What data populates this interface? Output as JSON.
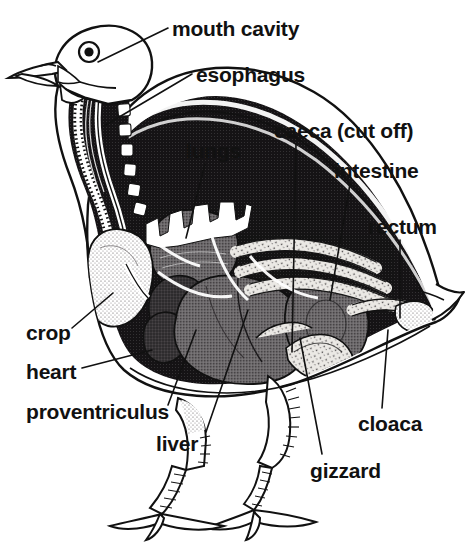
{
  "figure": {
    "background_color": "#ffffff",
    "ink_color": "#111111",
    "organ_gray": "#6d6a6c",
    "organ_dark": "#3a3739",
    "cavity_black": "#151315",
    "stipple_light": "#e8e6e2"
  },
  "labels": [
    {
      "id": "mouth-cavity",
      "text": "mouth cavity",
      "x": 172,
      "y": 18,
      "anchor": "left"
    },
    {
      "id": "esophagus",
      "text": "esophagus",
      "x": 196,
      "y": 64,
      "anchor": "left"
    },
    {
      "id": "caeca-cut-off",
      "text": "caeca (cut off)",
      "x": 274,
      "y": 120,
      "anchor": "left"
    },
    {
      "id": "lungs",
      "text": "lungs",
      "x": 186,
      "y": 140,
      "anchor": "left"
    },
    {
      "id": "intestine",
      "text": "intestine",
      "x": 334,
      "y": 160,
      "anchor": "left"
    },
    {
      "id": "rectum",
      "text": "rectum",
      "x": 368,
      "y": 216,
      "anchor": "left"
    },
    {
      "id": "crop",
      "text": "crop",
      "x": 26,
      "y": 322,
      "anchor": "left"
    },
    {
      "id": "heart",
      "text": "heart",
      "x": 26,
      "y": 361,
      "anchor": "left"
    },
    {
      "id": "proventriculus",
      "text": "proventriculus",
      "x": 26,
      "y": 401,
      "anchor": "left"
    },
    {
      "id": "liver",
      "text": "liver",
      "x": 156,
      "y": 433,
      "anchor": "left"
    },
    {
      "id": "gizzard",
      "text": "gizzard",
      "x": 310,
      "y": 460,
      "anchor": "left"
    },
    {
      "id": "cloaca",
      "text": "cloaca",
      "x": 358,
      "y": 413,
      "anchor": "left"
    }
  ],
  "leader_lines": [
    {
      "id": "leader-mouth-cavity",
      "for": "mouth-cavity",
      "points": "168,28 98,62"
    },
    {
      "id": "leader-esophagus",
      "for": "esophagus",
      "points": "192,74 104,126"
    },
    {
      "id": "leader-lungs",
      "for": "lungs",
      "points": "205,164 186,238"
    },
    {
      "id": "leader-caeca",
      "for": "caeca-cut-off",
      "points": "296,144 292,352"
    },
    {
      "id": "leader-intestine",
      "for": "intestine",
      "points": "350,184 330,300"
    },
    {
      "id": "leader-rectum",
      "for": "rectum",
      "points": "400,240 400,318"
    },
    {
      "id": "leader-crop",
      "for": "crop",
      "points": "72,328 113,293"
    },
    {
      "id": "leader-heart",
      "for": "heart",
      "points": "82,368 152,350"
    },
    {
      "id": "leader-proventriculus",
      "for": "proventriculus",
      "points": "168,405 196,330"
    },
    {
      "id": "leader-liver",
      "for": "liver",
      "points": "206,432 248,310"
    },
    {
      "id": "leader-gizzard",
      "for": "gizzard",
      "points": "322,454 300,338"
    },
    {
      "id": "leader-cloaca",
      "for": "cloaca",
      "points": "382,408 388,330"
    }
  ],
  "organs": [
    {
      "id": "crop-organ",
      "name": "crop",
      "shading": "light stipple"
    },
    {
      "id": "heart-organ",
      "name": "heart",
      "shading": "dark"
    },
    {
      "id": "liver-organ",
      "name": "liver",
      "shading": "mid gray stipple"
    },
    {
      "id": "gizzard-organ",
      "name": "gizzard",
      "shading": "mid gray stipple"
    },
    {
      "id": "lungs-organ",
      "name": "lungs",
      "shading": "gray with white comb ribs"
    },
    {
      "id": "proventriculus-organ",
      "name": "proventriculus",
      "shading": "dark"
    },
    {
      "id": "intestine-organ",
      "name": "intestine",
      "shading": "light stippled coils"
    },
    {
      "id": "caeca-organ",
      "name": "caeca",
      "shading": "light stippled tube"
    },
    {
      "id": "rectum-organ",
      "name": "rectum",
      "shading": "light stippled tube"
    },
    {
      "id": "cloaca-organ",
      "name": "cloaca",
      "shading": "light stipple"
    },
    {
      "id": "esophagus-organ",
      "name": "esophagus",
      "shading": "banded tube in neck"
    }
  ]
}
